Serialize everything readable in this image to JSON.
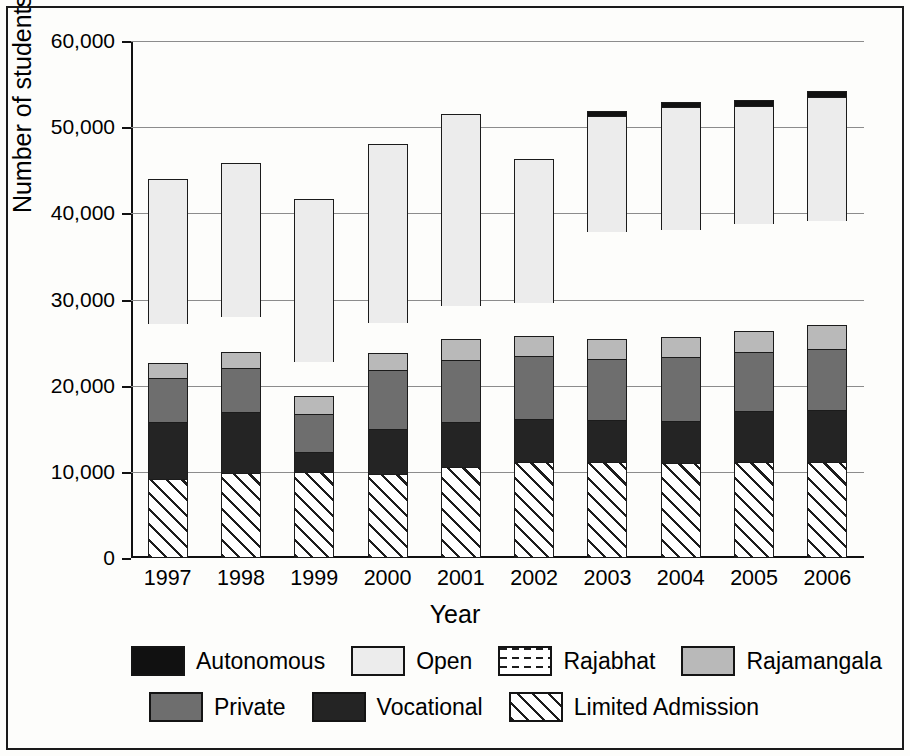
{
  "chart_data": {
    "type": "bar",
    "stacked": true,
    "title": "",
    "xlabel": "Year",
    "ylabel": "Number of students",
    "ylim": [
      0,
      60000
    ],
    "yticks": [
      0,
      10000,
      20000,
      30000,
      40000,
      50000,
      60000
    ],
    "ytick_labels": [
      "0",
      "10,000",
      "20,000",
      "30,000",
      "40,000",
      "50,000",
      "60,000"
    ],
    "grid": true,
    "legend_position": "bottom",
    "categories": [
      "1997",
      "1998",
      "1999",
      "2000",
      "2001",
      "2002",
      "2003",
      "2004",
      "2005",
      "2006"
    ],
    "series": [
      {
        "name": "Limited Admission",
        "fill": "diagonal-hatch",
        "color": "#ffffff",
        "values": [
          9200,
          9900,
          10000,
          9700,
          10600,
          11100,
          11200,
          11000,
          11100,
          11200
        ]
      },
      {
        "name": "Vocational",
        "fill": "solid-dark",
        "color": "#242424",
        "values": [
          6600,
          7100,
          2300,
          5300,
          5200,
          5000,
          4800,
          4900,
          6000,
          6000
        ]
      },
      {
        "name": "Private",
        "fill": "solid-medium-gray",
        "color": "#6e6e6e",
        "values": [
          5100,
          5100,
          4400,
          6800,
          7200,
          7400,
          7100,
          7400,
          6800,
          7100
        ]
      },
      {
        "name": "Rajamangala",
        "fill": "solid-light-gray",
        "color": "#b9b9b9",
        "values": [
          1700,
          1800,
          2100,
          2000,
          2400,
          2300,
          2300,
          2400,
          2500,
          2800
        ]
      },
      {
        "name": "Rajabhat",
        "fill": "dashed",
        "color": "#ffffff",
        "values": [
          4600,
          4100,
          3900,
          3500,
          3900,
          3800,
          12400,
          12400,
          12400,
          12000
        ]
      },
      {
        "name": "Open",
        "fill": "light-stipple",
        "color": "#ececec",
        "values": [
          16800,
          17800,
          19000,
          20700,
          22200,
          16700,
          13500,
          14200,
          13700,
          14400
        ]
      },
      {
        "name": "Autonomous",
        "fill": "solid-black",
        "color": "#111111",
        "values": [
          0,
          0,
          0,
          0,
          0,
          0,
          600,
          600,
          600,
          700
        ]
      }
    ],
    "totals": [
      44000,
      45800,
      41700,
      48000,
      51500,
      46300,
      51900,
      52900,
      53100,
      54200
    ]
  },
  "legend": {
    "items": [
      {
        "label": "Autonomous",
        "fill": "solid-black"
      },
      {
        "label": "Open",
        "fill": "light-stipple"
      },
      {
        "label": "Rajabhat",
        "fill": "dashed"
      },
      {
        "label": "Rajamangala",
        "fill": "solid-light-gray"
      },
      {
        "label": "Private",
        "fill": "solid-medium-gray"
      },
      {
        "label": "Vocational",
        "fill": "solid-dark"
      },
      {
        "label": "Limited Admission",
        "fill": "diagonal-hatch"
      }
    ]
  }
}
